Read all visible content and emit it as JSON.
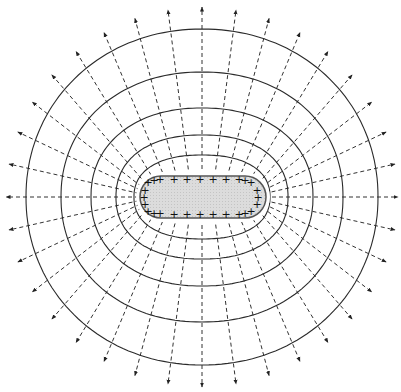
{
  "diagram": {
    "center": [
      202,
      197
    ],
    "colors": {
      "background": "#ffffff",
      "line": "#2a2a2a",
      "field_line": "#333333",
      "conductor_fill": "#d9d9d9",
      "conductor_stroke": "#555555",
      "charge": "#111111"
    },
    "conductor": {
      "shape": "stadium",
      "x": 140,
      "y": 176,
      "width": 126,
      "height": 42,
      "radius": 21,
      "charge_symbol": "+",
      "charges_top": [
        [
          148,
          182
        ],
        [
          154,
          180
        ],
        [
          160,
          179
        ],
        [
          174,
          179
        ],
        [
          187,
          179
        ],
        [
          200,
          179
        ],
        [
          213,
          179
        ],
        [
          226,
          179
        ],
        [
          239,
          179
        ],
        [
          245,
          180
        ],
        [
          251,
          182
        ]
      ],
      "charges_bottom": [
        [
          148,
          211
        ],
        [
          154,
          213
        ],
        [
          160,
          213
        ],
        [
          174,
          214
        ],
        [
          187,
          214
        ],
        [
          200,
          214
        ],
        [
          213,
          214
        ],
        [
          226,
          214
        ],
        [
          239,
          214
        ],
        [
          245,
          213
        ],
        [
          251,
          211
        ]
      ],
      "charges_left": [
        [
          145,
          190
        ],
        [
          144,
          197
        ],
        [
          145,
          204
        ]
      ],
      "charges_right": [
        [
          257,
          190
        ],
        [
          258,
          197
        ],
        [
          257,
          204
        ]
      ]
    },
    "equipotentials": [
      {
        "rx": 68,
        "ry": 42,
        "label": "equipotential-1"
      },
      {
        "rx": 86,
        "ry": 62,
        "label": "equipotential-2"
      },
      {
        "rx": 111,
        "ry": 89,
        "label": "equipotential-3"
      },
      {
        "rx": 141,
        "ry": 125,
        "label": "equipotential-4"
      },
      {
        "rx": 176,
        "ry": 168,
        "label": "equipotential-5"
      }
    ],
    "field_lines": {
      "count": 36,
      "style": "dashed",
      "arrow_direction": "outward",
      "end_radius_x": 196,
      "end_radius_y": 190
    }
  }
}
